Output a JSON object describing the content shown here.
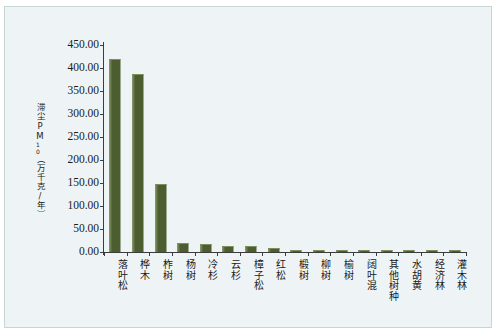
{
  "figure": {
    "background_color": "#eef4f5",
    "bar_color": "#4c5d2f",
    "axis_color": "#3c3c3c",
    "y_axis_title": "滞尘PM",
    "y_axis_title_sub": "10",
    "y_axis_title_unit": "（万千克/年）"
  },
  "chart_data": {
    "type": "bar",
    "title": "",
    "xlabel": "",
    "ylabel": "滞尘PM10（万千克/年）",
    "ylim": [
      0,
      450
    ],
    "ytick_step": 50,
    "grid": false,
    "legend": "none",
    "categories": [
      "落叶松",
      "桦木",
      "柞树",
      "杨树",
      "冷杉",
      "云杉",
      "樟子松",
      "红松",
      "椴树",
      "柳树",
      "榆树",
      "阔叶混",
      "其他树种",
      "水胡黄",
      "经济林",
      "灌木林"
    ],
    "values": [
      420.0,
      387.0,
      148.0,
      20.0,
      18.0,
      13.0,
      12.0,
      8.0,
      3.0,
      3.0,
      3.0,
      3.0,
      3.0,
      3.0,
      3.0,
      3.0
    ],
    "ytick_labels": [
      "0.00",
      "50.00",
      "100.00",
      "150.00",
      "200.00",
      "250.00",
      "300.00",
      "350.00",
      "400.00",
      "450.00"
    ],
    "ytick_values": [
      0,
      50,
      100,
      150,
      200,
      250,
      300,
      350,
      400,
      450
    ]
  }
}
